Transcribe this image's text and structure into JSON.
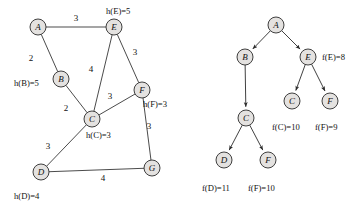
{
  "figure": {
    "width": 359,
    "height": 207,
    "node_fill": "#e4e2e0",
    "stroke": "#2b2b2b"
  },
  "graph": {
    "name": "weighted-graph",
    "nodes": [
      {
        "id": "A",
        "label": "A",
        "x": 38,
        "y": 27
      },
      {
        "id": "B",
        "label": "B",
        "x": 61,
        "y": 79
      },
      {
        "id": "C",
        "label": "C",
        "x": 92,
        "y": 119
      },
      {
        "id": "D",
        "label": "D",
        "x": 41,
        "y": 172
      },
      {
        "id": "E",
        "label": "E",
        "x": 114,
        "y": 27
      },
      {
        "id": "F",
        "label": "F",
        "x": 142,
        "y": 90
      },
      {
        "id": "G",
        "label": "G",
        "x": 152,
        "y": 168
      }
    ],
    "edges": [
      {
        "from": "A",
        "to": "E",
        "weight": "3",
        "lx": 76,
        "ly": 18
      },
      {
        "from": "A",
        "to": "B",
        "weight": "2",
        "lx": 31,
        "ly": 58
      },
      {
        "from": "B",
        "to": "C",
        "weight": "2",
        "lx": 66,
        "ly": 108
      },
      {
        "from": "E",
        "to": "C",
        "weight": "4",
        "lx": 91,
        "ly": 69
      },
      {
        "from": "E",
        "to": "F",
        "weight": "3",
        "lx": 135,
        "ly": 52
      },
      {
        "from": "C",
        "to": "F",
        "weight": "3",
        "lx": 110,
        "ly": 96
      },
      {
        "from": "C",
        "to": "D",
        "weight": "3",
        "lx": 48,
        "ly": 146
      },
      {
        "from": "F",
        "to": "G",
        "weight": "3",
        "lx": 149,
        "ly": 126
      },
      {
        "from": "D",
        "to": "G",
        "weight": "4",
        "lx": 103,
        "ly": 178
      }
    ],
    "heuristics": [
      {
        "node": "B",
        "text": "h(B)=5",
        "x": 14,
        "y": 83,
        "anchor": "start"
      },
      {
        "node": "E",
        "text": "h(E)=5",
        "x": 106,
        "y": 11,
        "anchor": "start"
      },
      {
        "node": "C",
        "text": "h(C)=3",
        "x": 86,
        "y": 135,
        "anchor": "start"
      },
      {
        "node": "F",
        "text": "h(F)=3",
        "x": 143,
        "y": 104,
        "anchor": "start"
      },
      {
        "node": "D",
        "text": "h(D)=4",
        "x": 14,
        "y": 196,
        "anchor": "start"
      }
    ]
  },
  "tree": {
    "name": "search-tree",
    "nodes": [
      {
        "id": "t-A",
        "label": "A",
        "x": 276,
        "y": 25
      },
      {
        "id": "t-B",
        "label": "B",
        "x": 245,
        "y": 57
      },
      {
        "id": "t-E",
        "label": "E",
        "x": 308,
        "y": 57
      },
      {
        "id": "t-C1",
        "label": "C",
        "x": 246,
        "y": 118
      },
      {
        "id": "t-C2",
        "label": "C",
        "x": 292,
        "y": 101
      },
      {
        "id": "t-F1",
        "label": "F",
        "x": 330,
        "y": 101
      },
      {
        "id": "t-D",
        "label": "D",
        "x": 224,
        "y": 160
      },
      {
        "id": "t-F2",
        "label": "F",
        "x": 268,
        "y": 160
      }
    ],
    "edges": [
      {
        "from": "t-A",
        "to": "t-B"
      },
      {
        "from": "t-A",
        "to": "t-E"
      },
      {
        "from": "t-B",
        "to": "t-C1"
      },
      {
        "from": "t-E",
        "to": "t-C2"
      },
      {
        "from": "t-E",
        "to": "t-F1"
      },
      {
        "from": "t-C1",
        "to": "t-D"
      },
      {
        "from": "t-C1",
        "to": "t-F2"
      }
    ],
    "costs": [
      {
        "node": "t-E",
        "text": "f(E)=8",
        "x": 322,
        "y": 57,
        "anchor": "start"
      },
      {
        "node": "t-C2",
        "text": "f(C)=10",
        "x": 272,
        "y": 127,
        "anchor": "start"
      },
      {
        "node": "t-F1",
        "text": "f(F)=9",
        "x": 315,
        "y": 127,
        "anchor": "start"
      },
      {
        "node": "t-D",
        "text": "f(D)=11",
        "x": 202,
        "y": 188,
        "anchor": "start"
      },
      {
        "node": "t-F2",
        "text": "f(F)=10",
        "x": 248,
        "y": 188,
        "anchor": "start"
      }
    ]
  }
}
